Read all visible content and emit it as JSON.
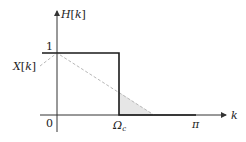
{
  "diagram": {
    "labels": {
      "y_axis": "H[k]",
      "x_axis": "k",
      "signal": "X[k]",
      "level_one": "1",
      "origin": "0",
      "cutoff": "Ω",
      "cutoff_sub": "c",
      "pi": "π"
    },
    "colors": {
      "axis": "#333333",
      "filter": "#1a1a1a",
      "dashed": "#b8b8b8",
      "shade": "#e6e6e6"
    }
  }
}
